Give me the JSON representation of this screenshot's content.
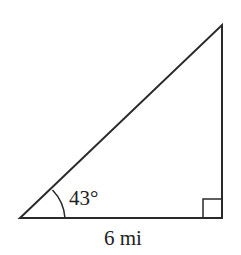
{
  "diagram": {
    "type": "right-triangle",
    "angle_label": "43°",
    "base_label": "6 mi",
    "right_angle_marker": true,
    "stroke_color": "#2a2a2a"
  }
}
